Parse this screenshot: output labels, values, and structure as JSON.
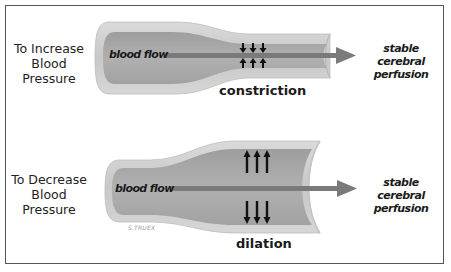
{
  "diagram": {
    "panels": [
      {
        "side_label_lines": [
          "To Increase",
          "Blood",
          "Pressure"
        ],
        "flow_label": "blood flow",
        "outcome_lines": [
          "stable cerebral",
          "perfusion"
        ],
        "state_label": "constriction",
        "arrow_direction": "inward"
      },
      {
        "side_label_lines": [
          "To Decrease",
          "Blood",
          "Pressure"
        ],
        "flow_label": "blood flow",
        "outcome_lines": [
          "stable cerebral",
          "perfusion"
        ],
        "state_label": "dilation",
        "arrow_direction": "outward"
      }
    ],
    "signature": "S.TRUEX"
  },
  "colors": {
    "vessel_wall": "#cfcfcf",
    "vessel_lumen": "#a9a9a9",
    "flow_arrow": "#7a7a7a",
    "frame": "#555555",
    "text": "#1a1a1a"
  }
}
